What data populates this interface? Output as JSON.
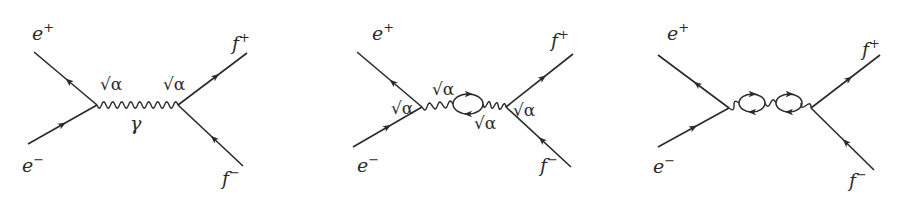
{
  "figure": {
    "line_color": "#2a2a2a",
    "background": "#ffffff"
  },
  "diagrams": [
    {
      "name": "tree-level",
      "particles": {
        "in_positron": {
          "base": "e",
          "charge": "+"
        },
        "in_electron": {
          "base": "e",
          "charge": "−"
        },
        "out_antifermion": {
          "base": "f",
          "charge": "+"
        },
        "out_fermion": {
          "base": "f",
          "charge": "−"
        }
      },
      "propagator": "photon",
      "propagator_label": "γ",
      "couplings": [
        "√α",
        "√α"
      ],
      "loops": 0
    },
    {
      "name": "one-loop",
      "particles": {
        "in_positron": {
          "base": "e",
          "charge": "+"
        },
        "in_electron": {
          "base": "e",
          "charge": "−"
        },
        "out_antifermion": {
          "base": "f",
          "charge": "+"
        },
        "out_fermion": {
          "base": "f",
          "charge": "−"
        }
      },
      "propagator": "photon",
      "couplings": [
        "√α",
        "√α",
        "√α",
        "√α"
      ],
      "loops": 1
    },
    {
      "name": "two-loop",
      "particles": {
        "in_positron": {
          "base": "e",
          "charge": "+"
        },
        "in_electron": {
          "base": "e",
          "charge": "−"
        },
        "out_antifermion": {
          "base": "f",
          "charge": "+"
        },
        "out_fermion": {
          "base": "f",
          "charge": "−"
        }
      },
      "propagator": "photon",
      "couplings": [],
      "loops": 2
    }
  ]
}
